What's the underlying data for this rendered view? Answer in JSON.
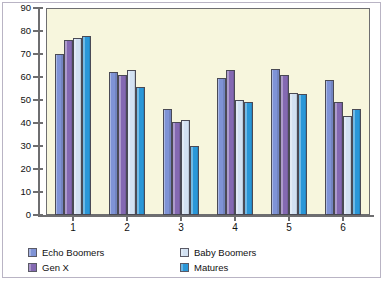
{
  "chart_data": {
    "type": "bar",
    "title": "",
    "subtitle": "",
    "xlabel": "",
    "ylabel": "",
    "categories": [
      "1",
      "2",
      "3",
      "4",
      "5",
      "6"
    ],
    "ylim": [
      0,
      90
    ],
    "yticks": [
      0,
      10,
      20,
      30,
      40,
      50,
      60,
      70,
      80,
      90
    ],
    "grid": false,
    "legend_position": "bottom",
    "series": [
      {
        "name": "Echo Boomers",
        "color": "#7f93d6",
        "values": [
          70,
          62,
          46,
          59.5,
          63.5,
          58.5
        ]
      },
      {
        "name": "Gen X",
        "color": "#8469b2",
        "values": [
          76,
          61,
          40.5,
          63,
          61,
          49
        ]
      },
      {
        "name": "Baby Boomers",
        "color": "#d2e1f2",
        "values": [
          77,
          63,
          41.5,
          50,
          53,
          43
        ]
      },
      {
        "name": "Matures",
        "color": "#2a97d8",
        "values": [
          78,
          55.5,
          30,
          49,
          52.5,
          46
        ]
      }
    ]
  },
  "colors": {
    "plot_background": "#f7f6dd",
    "page_background": "#ffffff",
    "axis": "#6e6e70",
    "frame": "#b9b4c4",
    "text": "#111111"
  }
}
